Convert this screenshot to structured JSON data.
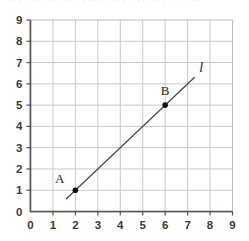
{
  "top_remnant_text": "··· ··· ·· ··· ····· ··· ··· ··· ·· ···",
  "chart_data": {
    "type": "scatter",
    "title": "",
    "xlabel": "",
    "ylabel": "",
    "xlim": [
      0,
      9
    ],
    "ylim": [
      0,
      9
    ],
    "grid": true,
    "grid_step": 1,
    "legend": "none",
    "background": "#ffffff",
    "grid_color": "#c9c9c9",
    "axis_color": "#555555",
    "line_color": "#4a4a4a",
    "point_color": "#111111",
    "x_ticks": [
      "0",
      "1",
      "2",
      "3",
      "4",
      "5",
      "6",
      "7",
      "8",
      "9"
    ],
    "y_ticks": [
      "0",
      "1",
      "2",
      "3",
      "4",
      "5",
      "6",
      "7",
      "8",
      "9"
    ],
    "points": [
      {
        "label": "A",
        "x": 2,
        "y": 1
      },
      {
        "label": "B",
        "x": 6,
        "y": 5
      }
    ],
    "lines": [
      {
        "label": "l",
        "through": [
          [
            2,
            1
          ],
          [
            6,
            5
          ]
        ],
        "slope": 1,
        "intercept": -1,
        "draw_from": [
          1.6,
          0.6
        ],
        "draw_to": [
          7.3,
          6.3
        ],
        "label_at": [
          7.6,
          6.55
        ]
      }
    ]
  }
}
